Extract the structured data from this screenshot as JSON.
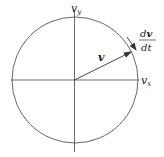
{
  "diagram": {
    "type": "velocity-circle",
    "axes": {
      "x_label": "v",
      "x_sub": "x",
      "y_label": "v",
      "y_sub": "y"
    },
    "vector_label": "v",
    "derivative_label": {
      "numerator": "dv",
      "numerator_prefix": "d",
      "numerator_bold": "v",
      "denominator": "dt"
    },
    "colors": {
      "line": "#333333",
      "background": "#ffffff"
    }
  }
}
